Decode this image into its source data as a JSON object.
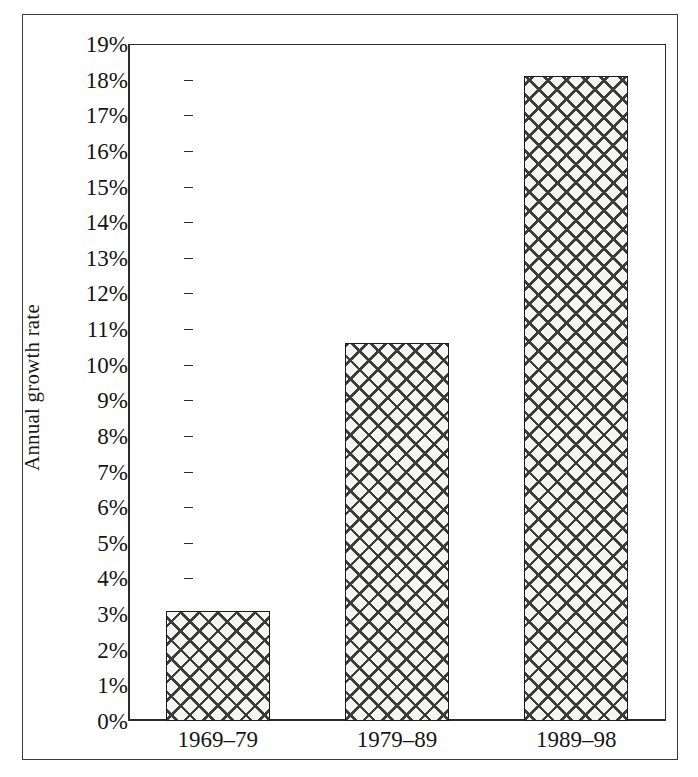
{
  "chart_data": {
    "type": "bar",
    "title": "",
    "subtitle": "",
    "xlabel": "",
    "ylabel": "Annual growth rate",
    "categories": [
      "1969–79",
      "1979–89",
      "1989–98"
    ],
    "values": [
      3.1,
      10.6,
      18.1
    ],
    "value_unit": "%",
    "ylim": [
      0,
      19
    ],
    "ytick_values": [
      0,
      1,
      2,
      3,
      4,
      5,
      6,
      7,
      8,
      9,
      10,
      11,
      12,
      13,
      14,
      15,
      16,
      17,
      18,
      19
    ],
    "ytick_labels": [
      "0%",
      "1%",
      "2%",
      "3%",
      "4%",
      "5%",
      "6%",
      "7%",
      "8%",
      "9%",
      "10%",
      "11%",
      "12%",
      "13%",
      "14%",
      "15%",
      "16%",
      "17%",
      "18%",
      "19%"
    ],
    "grid": false,
    "legend": null,
    "legend_position": "none",
    "series": [
      {
        "name": "Annual growth rate",
        "values": [
          3.1,
          10.6,
          18.1
        ],
        "fill": "crosshatch",
        "fill_color": "#f4f4f2",
        "hatch_color": "#3c3c3c",
        "edge_color": "#1c1c1c"
      }
    ],
    "annotations": []
  },
  "figure": {
    "background_color": "#ffffff",
    "frame_color": "#3a3a3a",
    "axis_color": "#2b2b2b",
    "text_color": "#151515"
  }
}
